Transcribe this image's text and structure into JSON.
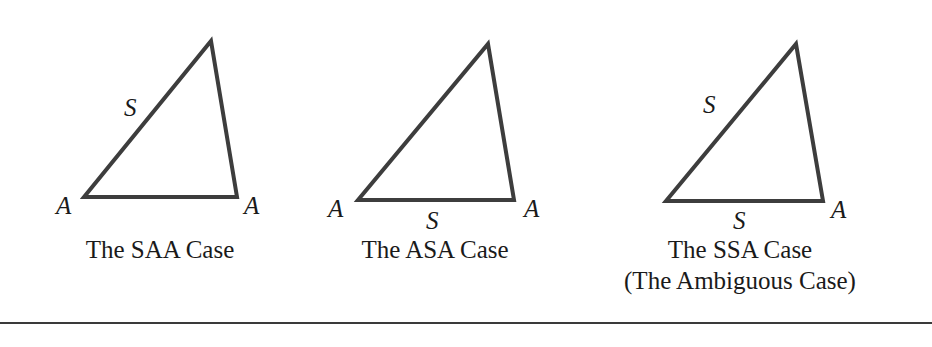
{
  "figure": {
    "panels": [
      {
        "id": "saa",
        "caption": "The SAA Case",
        "caption_line2": "",
        "labels": {
          "side_left": "S",
          "side_bottom": "",
          "vertex_left": "A",
          "vertex_right": "A"
        }
      },
      {
        "id": "asa",
        "caption": "The ASA Case",
        "caption_line2": "",
        "labels": {
          "side_left": "",
          "side_bottom": "S",
          "vertex_left": "A",
          "vertex_right": "A"
        }
      },
      {
        "id": "ssa",
        "caption": "The SSA Case",
        "caption_line2": "(The Ambiguous Case)",
        "labels": {
          "side_left": "S",
          "side_bottom": "S",
          "vertex_left": "",
          "vertex_right": "A"
        }
      }
    ],
    "stroke_color": "#3d3d3d",
    "rule_color": "#3a3a3a"
  }
}
